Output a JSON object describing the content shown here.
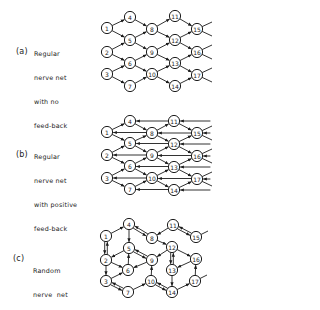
{
  "colors": {
    "background": "#ffffff",
    "ink": "#1c1c1c"
  },
  "panels": [
    {
      "id": "a",
      "tag": "(a)",
      "label_lines": [
        "Regular",
        "nerve net",
        "with no",
        "feed-back"
      ],
      "top": 0,
      "nodes": [
        {
          "id": "1",
          "x": 107,
          "y": 28
        },
        {
          "id": "4",
          "x": 130,
          "y": 17
        },
        {
          "id": "5",
          "x": 130,
          "y": 40
        },
        {
          "id": "2",
          "x": 107,
          "y": 52
        },
        {
          "id": "6",
          "x": 130,
          "y": 63
        },
        {
          "id": "3",
          "x": 107,
          "y": 74
        },
        {
          "id": "7",
          "x": 130,
          "y": 86
        },
        {
          "id": "8",
          "x": 152,
          "y": 29
        },
        {
          "id": "9",
          "x": 152,
          "y": 52
        },
        {
          "id": "10",
          "x": 152,
          "y": 74
        },
        {
          "id": "11",
          "x": 175,
          "y": 16
        },
        {
          "id": "12",
          "x": 175,
          "y": 40
        },
        {
          "id": "13",
          "x": 175,
          "y": 63
        },
        {
          "id": "14",
          "x": 175,
          "y": 86
        },
        {
          "id": "15",
          "x": 197,
          "y": 29
        },
        {
          "id": "16",
          "x": 197,
          "y": 52
        },
        {
          "id": "17",
          "x": 197,
          "y": 75
        }
      ],
      "edges": [
        [
          "1",
          "4"
        ],
        [
          "1",
          "5"
        ],
        [
          "2",
          "5"
        ],
        [
          "2",
          "6"
        ],
        [
          "3",
          "6"
        ],
        [
          "3",
          "7"
        ],
        [
          "4",
          "8"
        ],
        [
          "5",
          "8"
        ],
        [
          "5",
          "9"
        ],
        [
          "6",
          "9"
        ],
        [
          "6",
          "10"
        ],
        [
          "7",
          "10"
        ],
        [
          "8",
          "11"
        ],
        [
          "8",
          "12"
        ],
        [
          "9",
          "12"
        ],
        [
          "9",
          "13"
        ],
        [
          "10",
          "13"
        ],
        [
          "10",
          "14"
        ],
        [
          "11",
          "15"
        ],
        [
          "12",
          "15"
        ],
        [
          "12",
          "16"
        ],
        [
          "13",
          "16"
        ],
        [
          "13",
          "17"
        ],
        [
          "14",
          "17"
        ]
      ],
      "stubs": [
        [
          "15",
          212,
          22
        ],
        [
          "15",
          212,
          36
        ],
        [
          "16",
          212,
          45
        ],
        [
          "16",
          212,
          59
        ],
        [
          "17",
          212,
          68
        ],
        [
          "17",
          212,
          82
        ]
      ],
      "feedback": []
    },
    {
      "id": "b",
      "tag": "(b)",
      "label_lines": [
        "Regular",
        "nerve net",
        "with positive",
        "feed-back"
      ],
      "top": 0,
      "nodes": [
        {
          "id": "1",
          "x": 107,
          "y": 132
        },
        {
          "id": "4",
          "x": 130,
          "y": 121
        },
        {
          "id": "5",
          "x": 130,
          "y": 143
        },
        {
          "id": "2",
          "x": 107,
          "y": 155
        },
        {
          "id": "6",
          "x": 130,
          "y": 166
        },
        {
          "id": "3",
          "x": 107,
          "y": 178
        },
        {
          "id": "7",
          "x": 130,
          "y": 189
        },
        {
          "id": "8",
          "x": 152,
          "y": 133
        },
        {
          "id": "9",
          "x": 152,
          "y": 155
        },
        {
          "id": "10",
          "x": 152,
          "y": 178
        },
        {
          "id": "11",
          "x": 174,
          "y": 121
        },
        {
          "id": "12",
          "x": 174,
          "y": 144
        },
        {
          "id": "13",
          "x": 174,
          "y": 167
        },
        {
          "id": "14",
          "x": 174,
          "y": 190
        },
        {
          "id": "15",
          "x": 197,
          "y": 133
        },
        {
          "id": "16",
          "x": 197,
          "y": 156
        },
        {
          "id": "17",
          "x": 197,
          "y": 179
        }
      ],
      "edges": [
        [
          "1",
          "4"
        ],
        [
          "1",
          "5"
        ],
        [
          "2",
          "5"
        ],
        [
          "2",
          "6"
        ],
        [
          "3",
          "6"
        ],
        [
          "3",
          "7"
        ],
        [
          "4",
          "8"
        ],
        [
          "5",
          "8"
        ],
        [
          "5",
          "9"
        ],
        [
          "6",
          "9"
        ],
        [
          "6",
          "10"
        ],
        [
          "7",
          "10"
        ],
        [
          "8",
          "11"
        ],
        [
          "8",
          "12"
        ],
        [
          "9",
          "12"
        ],
        [
          "9",
          "13"
        ],
        [
          "10",
          "13"
        ],
        [
          "10",
          "14"
        ],
        [
          "11",
          "15"
        ],
        [
          "12",
          "15"
        ],
        [
          "12",
          "16"
        ],
        [
          "13",
          "16"
        ],
        [
          "13",
          "17"
        ],
        [
          "14",
          "17"
        ]
      ],
      "stubs": [
        [
          "15",
          212,
          126
        ],
        [
          "15",
          212,
          140
        ],
        [
          "16",
          212,
          149
        ],
        [
          "16",
          212,
          163
        ],
        [
          "17",
          212,
          172
        ],
        [
          "17",
          212,
          186
        ]
      ],
      "feedback": [
        [
          "8",
          "1"
        ],
        [
          "9",
          "2"
        ],
        [
          "10",
          "3"
        ],
        [
          "11",
          "4"
        ],
        [
          "12",
          "5"
        ],
        [
          "13",
          "6"
        ],
        [
          "14",
          "7"
        ],
        [
          "15",
          "8"
        ],
        [
          "16",
          "9"
        ],
        [
          "17",
          "10"
        ]
      ],
      "feedback_in": [
        {
          "to": "11",
          "y": 121
        },
        {
          "to": "15",
          "y": 133
        },
        {
          "to": "12",
          "y": 144
        },
        {
          "to": "16",
          "y": 156
        },
        {
          "to": "13",
          "y": 167
        },
        {
          "to": "17",
          "y": 179
        },
        {
          "to": "14",
          "y": 190
        }
      ]
    },
    {
      "id": "c",
      "tag": "(c)",
      "label_lines": [
        "Random",
        "nerve  net"
      ],
      "top": 0,
      "nodes": [
        {
          "id": "1",
          "x": 106,
          "y": 236
        },
        {
          "id": "4",
          "x": 129,
          "y": 224
        },
        {
          "id": "5",
          "x": 129,
          "y": 248
        },
        {
          "id": "2",
          "x": 106,
          "y": 260
        },
        {
          "id": "6",
          "x": 128,
          "y": 270
        },
        {
          "id": "3",
          "x": 106,
          "y": 281
        },
        {
          "id": "7",
          "x": 128,
          "y": 292
        },
        {
          "id": "8",
          "x": 152,
          "y": 238
        },
        {
          "id": "9",
          "x": 152,
          "y": 260
        },
        {
          "id": "10",
          "x": 151,
          "y": 281
        },
        {
          "id": "11",
          "x": 173,
          "y": 225
        },
        {
          "id": "12",
          "x": 172,
          "y": 247
        },
        {
          "id": "13",
          "x": 172,
          "y": 270
        },
        {
          "id": "14",
          "x": 172,
          "y": 292
        },
        {
          "id": "15",
          "x": 196,
          "y": 237
        },
        {
          "id": "16",
          "x": 196,
          "y": 259
        },
        {
          "id": "17",
          "x": 195,
          "y": 281
        }
      ],
      "edges": [
        [
          "1",
          "4"
        ],
        [
          "4",
          "5"
        ],
        [
          "5",
          "2"
        ],
        [
          "2",
          "6"
        ],
        [
          "6",
          "5"
        ],
        [
          "9",
          "6"
        ],
        [
          "2",
          "3"
        ],
        [
          "3",
          "6"
        ],
        [
          "7",
          "10"
        ],
        [
          "10",
          "9"
        ],
        [
          "11",
          "8"
        ],
        [
          "8",
          "12"
        ],
        [
          "12",
          "9"
        ],
        [
          "12",
          "16"
        ],
        [
          "16",
          "13"
        ],
        [
          "13",
          "14"
        ],
        [
          "14",
          "17"
        ],
        [
          "17",
          "16"
        ]
      ],
      "double_edges": [
        [
          "4",
          "8"
        ],
        [
          "1",
          "2"
        ],
        [
          "5",
          "9"
        ],
        [
          "3",
          "7"
        ],
        [
          "11",
          "15"
        ],
        [
          "12",
          "13"
        ],
        [
          "10",
          "14"
        ]
      ],
      "stubs": [
        [
          "15",
          208,
          231
        ],
        [
          "17",
          207,
          275
        ]
      ],
      "feedback": []
    }
  ],
  "text_positions": {
    "a": {
      "tag_x": 16,
      "tag_y": 48,
      "label_x": 34,
      "label_y": 34
    },
    "b": {
      "tag_x": 16,
      "tag_y": 151,
      "label_x": 34,
      "label_y": 137
    },
    "c": {
      "tag_x": 13,
      "tag_y": 255,
      "label_x": 33,
      "label_y": 251
    }
  }
}
